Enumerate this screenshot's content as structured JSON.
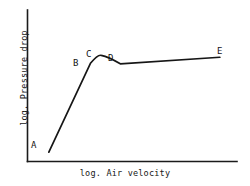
{
  "chart_data": {
    "type": "line",
    "title": "",
    "xlabel": "log. Air velocity",
    "ylabel": "log. Pressure drop",
    "grid": false,
    "legend": null,
    "axis_style": "schematic-log-log-no-ticks",
    "xlim": [
      0,
      1
    ],
    "ylim": [
      0,
      1
    ],
    "series": [
      {
        "name": "pressure-drop-vs-air-velocity",
        "points": [
          {
            "label": "A",
            "x": 0.057,
            "y": 0.062
          },
          {
            "label": "B",
            "x": 0.276,
            "y": 0.648
          },
          {
            "label": "C",
            "x": 0.333,
            "y": 0.7
          },
          {
            "label": "D",
            "x": 0.433,
            "y": 0.645
          },
          {
            "label": "E",
            "x": 0.957,
            "y": 0.688
          }
        ]
      }
    ],
    "annotations": [
      {
        "text": "A",
        "point": "A",
        "position": "left-above"
      },
      {
        "text": "B",
        "point": "B",
        "position": "left-above"
      },
      {
        "text": "C",
        "point": "C",
        "position": "above"
      },
      {
        "text": "D",
        "point": "D",
        "position": "above"
      },
      {
        "text": "E",
        "point": "E",
        "position": "above"
      }
    ]
  },
  "labels": {
    "a": "A",
    "b": "B",
    "c": "C",
    "d": "D",
    "e": "E"
  },
  "axes": {
    "x_title": "log. Air velocity",
    "y_title": "log. Pressure drop"
  },
  "colors": {
    "line": "#161616",
    "axis": "#1b1b1b",
    "background": "#ffffff",
    "text": "#141414"
  }
}
